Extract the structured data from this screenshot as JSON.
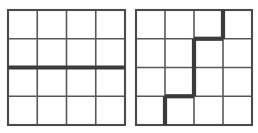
{
  "figure": {
    "title": "",
    "caption": "",
    "background_color": "#ffffff",
    "thin_line_color": "#58595b",
    "thick_line_color": "#3a3b3d",
    "frame_line_color": "#4a4b4d",
    "panel_count": 2
  },
  "chart_data": {
    "type": "diagram",
    "title": "",
    "xlabel": "",
    "ylabel": "",
    "grid_rows": 4,
    "grid_cols": 4,
    "panels": [
      {
        "name": "left-grid",
        "label": "",
        "rows": 4,
        "cols": 4,
        "origin_px": [
          8,
          10
        ],
        "size_px": [
          117,
          115
        ],
        "thick_edges": [
          {
            "orientation": "horizontal",
            "row_line": 2,
            "col_start": 0,
            "col_end": 4,
            "note": "full-width heavy line across the middle of the grid"
          }
        ]
      },
      {
        "name": "right-grid",
        "label": "",
        "rows": 4,
        "cols": 4,
        "origin_px": [
          136,
          10
        ],
        "size_px": [
          116,
          115
        ],
        "thick_edges": [
          {
            "orientation": "vertical",
            "col_line": 3,
            "row_start": 0,
            "row_end": 1,
            "note": "heavy segment from top edge down one cell"
          },
          {
            "orientation": "horizontal",
            "row_line": 1,
            "col_start": 2,
            "col_end": 3,
            "note": "heavy segment one cell wide"
          },
          {
            "orientation": "vertical",
            "col_line": 2,
            "row_start": 1,
            "row_end": 3,
            "note": "heavy segment spanning two cells downward"
          },
          {
            "orientation": "horizontal",
            "row_line": 3,
            "col_start": 1,
            "col_end": 2,
            "note": "heavy segment one cell wide"
          },
          {
            "orientation": "vertical",
            "col_line": 1,
            "row_start": 3,
            "row_end": 4,
            "note": "heavy segment from third row line to bottom edge"
          }
        ]
      }
    ]
  }
}
